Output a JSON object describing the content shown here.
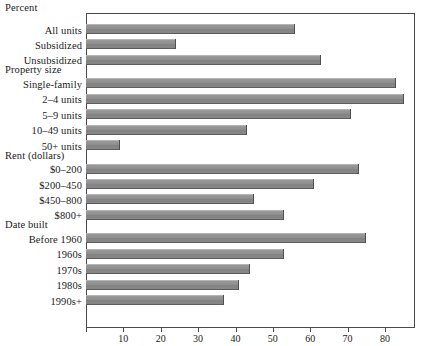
{
  "chart_data": {
    "type": "bar",
    "orientation": "horizontal",
    "title": "Percent",
    "xlabel": "",
    "ylabel": "",
    "xlim": [
      0,
      88
    ],
    "grid": false,
    "legend": null,
    "xticks": [
      0,
      10,
      20,
      30,
      40,
      50,
      60,
      70,
      80
    ],
    "xtick_labels": [
      "",
      "10",
      "20",
      "30",
      "40",
      "50",
      "60",
      "70",
      "80"
    ],
    "bar_color": "#8a8a8a",
    "groups": [
      {
        "heading": "",
        "items": [
          {
            "label": "All units",
            "value": 56
          },
          {
            "label": "Subsidized",
            "value": 24
          },
          {
            "label": "Unsubsidized",
            "value": 63
          }
        ]
      },
      {
        "heading": "Property size",
        "items": [
          {
            "label": "Single-family",
            "value": 83
          },
          {
            "label": "2–4 units",
            "value": 85
          },
          {
            "label": "5–9 units",
            "value": 71
          },
          {
            "label": "10–49 units",
            "value": 43
          },
          {
            "label": "50+ units",
            "value": 9
          }
        ]
      },
      {
        "heading": "Rent (dollars)",
        "items": [
          {
            "label": "$0–200",
            "value": 73
          },
          {
            "label": "$200–450",
            "value": 61
          },
          {
            "label": "$450–800",
            "value": 45
          },
          {
            "label": "$800+",
            "value": 53
          }
        ]
      },
      {
        "heading": "Date built",
        "items": [
          {
            "label": "Before 1960",
            "value": 75
          },
          {
            "label": "1960s",
            "value": 53
          },
          {
            "label": "1970s",
            "value": 44
          },
          {
            "label": "1980s",
            "value": 41
          },
          {
            "label": "1990s+",
            "value": 37
          }
        ]
      }
    ]
  }
}
